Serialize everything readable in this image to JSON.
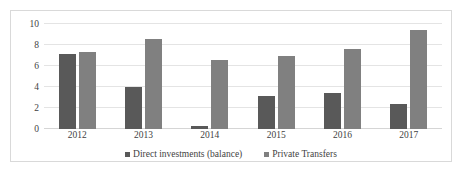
{
  "chart_data": {
    "type": "bar",
    "title": "",
    "xlabel": "",
    "ylabel": "",
    "categories": [
      "2012",
      "2013",
      "2014",
      "2015",
      "2016",
      "2017"
    ],
    "series": [
      {
        "name": "Direct investments (balance)",
        "color": "#595959",
        "values": [
          7.1,
          4.0,
          0.3,
          3.1,
          3.4,
          2.4
        ]
      },
      {
        "name": "Private Transfers",
        "color": "#808080",
        "values": [
          7.3,
          8.6,
          6.6,
          7.0,
          7.6,
          9.4
        ]
      }
    ],
    "ylim": [
      0,
      10
    ],
    "yticks": [
      "0",
      "2",
      "4",
      "6",
      "8",
      "10"
    ],
    "ytick_values": [
      0,
      2,
      4,
      6,
      8,
      10
    ],
    "grid": true,
    "legend_position": "bottom",
    "border_color": "#d9d9d9",
    "gridline_color": "#e4e4e4",
    "text_color": "#3f3f3f"
  }
}
